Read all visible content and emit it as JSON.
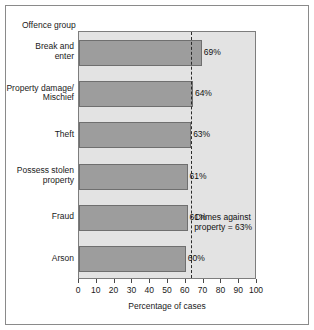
{
  "chart_data": {
    "type": "bar",
    "orientation": "horizontal",
    "title": "",
    "xlabel": "Percentage of cases",
    "ylabel": "Offence group",
    "categories": [
      "Break and enter",
      "Property damage/ Mischief",
      "Theft",
      "Possess stolen property",
      "Fraud",
      "Arson"
    ],
    "values": [
      69,
      64,
      63,
      61,
      61,
      60
    ],
    "value_labels": [
      "69%",
      "64%",
      "63%",
      "61%",
      "61%",
      "60%"
    ],
    "xlim": [
      0,
      100
    ],
    "xticks": [
      0,
      10,
      20,
      30,
      40,
      50,
      60,
      70,
      80,
      90,
      100
    ],
    "xtick_labels": [
      "0",
      "10",
      "20",
      "30",
      "40",
      "50",
      "60",
      "70",
      "80",
      "90",
      "100"
    ],
    "grid": true,
    "legend": "none",
    "reference_line": {
      "value": 63,
      "style": "dashed",
      "label_line1": "Crimes against",
      "label_line2": "property = 63%"
    },
    "colors": {
      "bar_fill": "#9d9d9d",
      "bar_edge": "#6f6f6f",
      "plot_background": "#e9e9e9",
      "band": "#e3e3e3",
      "gridline": "#9a9a9a",
      "reference_line": "#2b2b2b",
      "frame": "#8a8a8a",
      "text": "#1a1a1a"
    }
  },
  "category_label_lines": [
    [
      "Break and",
      "enter"
    ],
    [
      "Property damage/",
      "Mischief"
    ],
    [
      "Theft"
    ],
    [
      "Possess stolen",
      "property"
    ],
    [
      "Fraud"
    ],
    [
      "Arson"
    ]
  ]
}
